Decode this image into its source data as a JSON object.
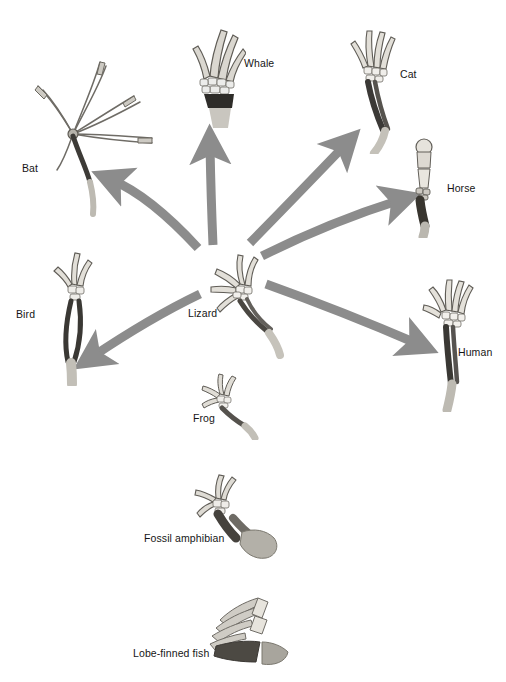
{
  "figure": {
    "kind": "homologous-forelimb-diagram",
    "background_color": "#ffffff",
    "arrow_color": "#8c8c8c",
    "bone_light_color": "#d8d5cf",
    "bone_mid_color": "#9b9890",
    "bone_dark_color": "#4a4a4a",
    "label_color": "#161616",
    "label_font_size_px": 10.5
  },
  "hub": {
    "name": "Lizard",
    "label": "Lizard",
    "label_x": 188,
    "label_y": 313,
    "center_x": 232,
    "center_y": 272
  },
  "radiating_taxa": [
    {
      "id": "bat",
      "label": "Bat",
      "label_x": 22,
      "label_y": 163,
      "limb_type": "elongated-digit-wing",
      "arrow": {
        "from_x": 198,
        "from_y": 248,
        "ctrl_x": 150,
        "ctrl_y": 196,
        "to_x": 108,
        "to_y": 178
      }
    },
    {
      "id": "whale",
      "label": "Whale",
      "label_x": 244,
      "label_y": 63,
      "limb_type": "flipper",
      "arrow": {
        "from_x": 213,
        "from_y": 245,
        "ctrl_x": 211,
        "ctrl_y": 195,
        "to_x": 210,
        "to_y": 140
      }
    },
    {
      "id": "cat",
      "label": "Cat",
      "label_x": 400,
      "label_y": 74,
      "limb_type": "digitigrade-paw",
      "arrow": {
        "from_x": 250,
        "from_y": 243,
        "ctrl_x": 296,
        "ctrl_y": 196,
        "to_x": 348,
        "to_y": 142
      }
    },
    {
      "id": "horse",
      "label": "Horse",
      "label_x": 447,
      "label_y": 188,
      "limb_type": "single-digit-hoof",
      "arrow": {
        "from_x": 262,
        "from_y": 256,
        "ctrl_x": 330,
        "ctrl_y": 222,
        "to_x": 404,
        "to_y": 199
      }
    },
    {
      "id": "human",
      "label": "Human",
      "label_x": 458,
      "label_y": 352,
      "limb_type": "grasping-hand",
      "arrow": {
        "from_x": 266,
        "from_y": 284,
        "ctrl_x": 344,
        "ctrl_y": 312,
        "to_x": 422,
        "to_y": 345
      }
    },
    {
      "id": "bird",
      "label": "Bird",
      "label_x": 16,
      "label_y": 314,
      "limb_type": "fused-wing",
      "arrow": {
        "from_x": 200,
        "from_y": 294,
        "ctrl_x": 148,
        "ctrl_y": 318,
        "to_x": 88,
        "to_y": 360
      }
    }
  ],
  "ancestral_taxa": [
    {
      "id": "frog",
      "label": "Frog",
      "label_x": 193,
      "label_y": 418,
      "limb_type": "amphibian-hand"
    },
    {
      "id": "fossil-amphibian",
      "label": "Fossil amphibian",
      "label_x": 144,
      "label_y": 538,
      "limb_type": "stout-fossil-limb"
    },
    {
      "id": "lobe-finned-fish",
      "label": "Lobe-finned fish",
      "label_x": 133,
      "label_y": 653,
      "limb_type": "lobe-fin"
    }
  ]
}
